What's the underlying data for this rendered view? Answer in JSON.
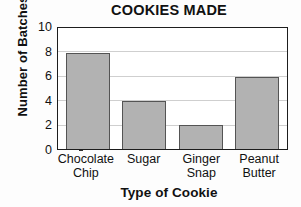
{
  "chart_data": {
    "type": "bar",
    "title": "COOKIES MADE",
    "xlabel": "Type of Cookie",
    "ylabel": "Number of Batches",
    "categories": [
      "Chocolate Chip",
      "Sugar",
      "Ginger Snap",
      "Peanut Butter"
    ],
    "category_lines": [
      [
        "Chocolate",
        "Chip"
      ],
      [
        "Sugar"
      ],
      [
        "Ginger",
        "Snap"
      ],
      [
        "Peanut",
        "Butter"
      ]
    ],
    "values": [
      8,
      4,
      2,
      6
    ],
    "ylim": [
      0,
      10
    ],
    "ytick_values": [
      10,
      8,
      6,
      4,
      2,
      0
    ],
    "ytick_labels": [
      "10",
      "8",
      "6",
      "4",
      "2",
      "0"
    ],
    "grid": true,
    "grid_orientation": "horizontal",
    "legend": false,
    "bar_color": "#b2b2b2",
    "bar_edge_color": "#545454",
    "axis_color": "#1d1d1d",
    "grid_color": "#cfcfcf",
    "background_color": "#fdfdfd"
  }
}
